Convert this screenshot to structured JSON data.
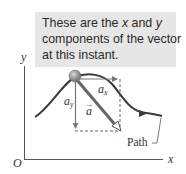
{
  "callout": {
    "line1_a": "These are the ",
    "line1_x": "x",
    "line1_b": " and ",
    "line1_y": "y",
    "line2": "components of the vector",
    "line3": "at this instant."
  },
  "axes": {
    "y_label": "y",
    "x_label": "x",
    "origin_label": "O"
  },
  "vectors": {
    "ax_label": "a",
    "ax_sub": "x",
    "ay_label": "a",
    "ay_sub": "y",
    "a_label": "a",
    "a_arrow": "→"
  },
  "path_label": "Path",
  "colors": {
    "callout_bg": "#e6e6e6",
    "path": "#3a3a3a",
    "vector": "#555555",
    "ball": "#8c8c8c"
  }
}
